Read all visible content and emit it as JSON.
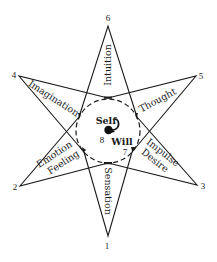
{
  "diagram": {
    "type": "star-of-functions",
    "center": {
      "self_label": "Self",
      "self_number": "8",
      "will_label": "Will",
      "will_number": "7"
    },
    "points": [
      {
        "number": "1",
        "function": "Sensation"
      },
      {
        "number": "2",
        "function_line1": "Emotion",
        "function_line2": "Feeling"
      },
      {
        "number": "3",
        "function_line1": "Impulse",
        "function_line2": "Desire"
      },
      {
        "number": "4",
        "function": "Imagination"
      },
      {
        "number": "5",
        "function": "Thought"
      },
      {
        "number": "6",
        "function": "Intuition"
      }
    ],
    "colors": {
      "line": "#1a1a1a",
      "background": "#ffffff"
    }
  }
}
